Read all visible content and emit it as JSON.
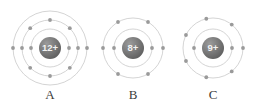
{
  "figure": {
    "type": "bohr-atomic-model-diagram",
    "background_color": "#ffffff",
    "shell_stroke_color": "#c9c9c9",
    "electron_color": "#9a9a9a",
    "nucleus_fill_color": "#6e6e6e",
    "nucleus_text_color": "#f2f2f2",
    "label_color": "#3b3b3b",
    "atoms": [
      {
        "label": "A",
        "nucleus_charge": "12+",
        "center_x": 50,
        "center_y": 48,
        "nucleus_radius": 11,
        "shells": [
          {
            "radius": 19,
            "electrons": 2,
            "angles": [
              0,
              180
            ]
          },
          {
            "radius": 28,
            "electrons": 8,
            "angles": [
              0,
              45,
              90,
              135,
              180,
              225,
              270,
              315
            ]
          },
          {
            "radius": 37,
            "electrons": 2,
            "angles": [
              0,
              180
            ]
          }
        ]
      },
      {
        "label": "B",
        "nucleus_charge": "8+",
        "center_x": 133,
        "center_y": 48,
        "nucleus_radius": 11,
        "shells": [
          {
            "radius": 19,
            "electrons": 2,
            "angles": [
              0,
              180
            ]
          },
          {
            "radius": 30,
            "electrons": 6,
            "angles": [
              0,
              60,
              120,
              180,
              240,
              300
            ]
          }
        ]
      },
      {
        "label": "C",
        "nucleus_charge": "9+",
        "center_x": 213,
        "center_y": 48,
        "nucleus_radius": 11,
        "shells": [
          {
            "radius": 19,
            "electrons": 2,
            "angles": [
              0,
              180
            ]
          },
          {
            "radius": 30,
            "electrons": 7,
            "angles": [
              0,
              51.4,
              102.9,
              154.3,
              205.7,
              257.1,
              308.6
            ]
          }
        ]
      }
    ]
  }
}
